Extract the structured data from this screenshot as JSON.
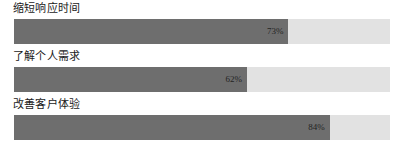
{
  "chart_data": {
    "type": "bar",
    "orientation": "horizontal",
    "title": "",
    "subtitle": "",
    "xlabel": "",
    "ylabel": "",
    "xlim": [
      0,
      100
    ],
    "grid": false,
    "legend": null,
    "value_suffix": "%",
    "categories": [
      "缩短响应时间",
      "了解个人需求",
      "改善客户体验"
    ],
    "values": [
      73,
      62,
      84
    ],
    "value_labels": [
      "73%",
      "62%",
      "84%"
    ],
    "colors": {
      "fill": "#6e6e6e",
      "track": "#e2e2e2",
      "label_text": "#1a1a1a",
      "value_text": "#242424",
      "background": "#ffffff"
    },
    "bars": [
      {
        "label": "缩短响应时间",
        "value": 73,
        "value_label": "73%"
      },
      {
        "label": "了解个人需求",
        "value": 62,
        "value_label": "62%"
      },
      {
        "label": "改善客户体验",
        "value": 84,
        "value_label": "84%"
      }
    ]
  }
}
